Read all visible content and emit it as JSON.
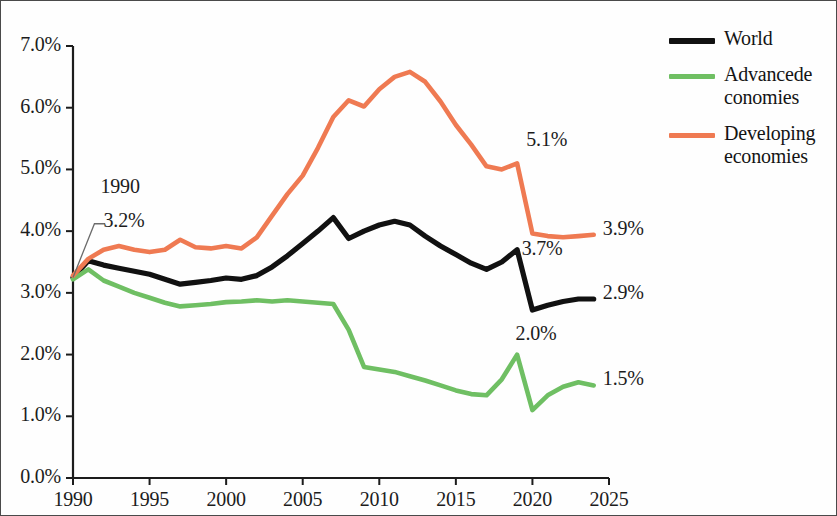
{
  "chart_data": {
    "type": "line",
    "title": "",
    "xlabel": "",
    "ylabel": "",
    "xlim": [
      1990,
      2025
    ],
    "ylim": [
      0,
      7
    ],
    "grid": false,
    "legend_position": "right",
    "x_ticks": [
      "1990",
      "1995",
      "2000",
      "2005",
      "2010",
      "2015",
      "2020",
      "2025"
    ],
    "y_ticks": [
      "0.0%",
      "1.0%",
      "2.0%",
      "3.0%",
      "4.0%",
      "5.0%",
      "6.0%",
      "7.0%"
    ],
    "x": [
      1990,
      1991,
      1992,
      1993,
      1994,
      1995,
      1996,
      1997,
      1998,
      1999,
      2000,
      2001,
      2002,
      2003,
      2004,
      2005,
      2006,
      2007,
      2008,
      2009,
      2010,
      2011,
      2012,
      2013,
      2014,
      2015,
      2016,
      2017,
      2018,
      2019,
      2020,
      2021,
      2022,
      2023,
      2024
    ],
    "series": [
      {
        "name": "World",
        "color": "#111111",
        "values": [
          3.25,
          3.52,
          3.45,
          3.4,
          3.35,
          3.3,
          3.22,
          3.14,
          3.17,
          3.2,
          3.24,
          3.22,
          3.28,
          3.42,
          3.6,
          3.8,
          4.0,
          4.22,
          3.88,
          4.0,
          4.1,
          4.16,
          4.1,
          3.92,
          3.76,
          3.62,
          3.48,
          3.38,
          3.5,
          3.7,
          2.72,
          2.8,
          2.86,
          2.9,
          2.9
        ]
      },
      {
        "name": "Advancede conomies",
        "color": "#6fbf63",
        "values": [
          3.22,
          3.38,
          3.2,
          3.1,
          3.0,
          2.92,
          2.84,
          2.78,
          2.8,
          2.82,
          2.85,
          2.86,
          2.88,
          2.86,
          2.88,
          2.86,
          2.84,
          2.82,
          2.4,
          1.8,
          1.76,
          1.72,
          1.65,
          1.58,
          1.5,
          1.42,
          1.36,
          1.34,
          1.6,
          2.0,
          1.1,
          1.34,
          1.48,
          1.55,
          1.5
        ]
      },
      {
        "name": "Developing economies",
        "color": "#ef7a52",
        "values": [
          3.28,
          3.55,
          3.7,
          3.76,
          3.7,
          3.66,
          3.7,
          3.86,
          3.74,
          3.72,
          3.76,
          3.72,
          3.9,
          4.25,
          4.6,
          4.9,
          5.35,
          5.85,
          6.12,
          6.02,
          6.3,
          6.5,
          6.58,
          6.42,
          6.1,
          5.72,
          5.4,
          5.05,
          5.0,
          5.1,
          3.96,
          3.92,
          3.9,
          3.92,
          3.94
        ]
      }
    ],
    "annotations": [
      {
        "name": "start-callout",
        "line1": "1990",
        "line2": "3.2%",
        "x": 1990,
        "y": 3.2
      },
      {
        "name": "developing-2019",
        "text": "5.1%",
        "x": 2019,
        "y": 5.1
      },
      {
        "name": "developing-2024",
        "text": "3.9%",
        "x": 2024,
        "y": 3.94
      },
      {
        "name": "world-2019",
        "text": "3.7%",
        "x": 2019,
        "y": 3.7
      },
      {
        "name": "world-2024",
        "text": "2.9%",
        "x": 2024,
        "y": 2.9
      },
      {
        "name": "advanced-2019",
        "text": "2.0%",
        "x": 2019,
        "y": 2.0
      },
      {
        "name": "advanced-2024",
        "text": "1.5%",
        "x": 2024,
        "y": 1.5
      }
    ]
  },
  "legend": {
    "items": [
      {
        "label": "World",
        "color": "#111111"
      },
      {
        "label": "Advancede conomies",
        "color": "#6fbf63"
      },
      {
        "label": "Developing economies",
        "color": "#ef7a52"
      }
    ]
  }
}
